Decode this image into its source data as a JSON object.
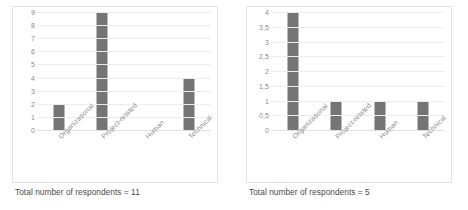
{
  "figure": {
    "panels": [
      {
        "panel_name": "left-chart-panel",
        "caption": "Total number of respondents = 11",
        "chart_data": {
          "type": "bar",
          "title": "",
          "xlabel": "",
          "ylabel": "",
          "categories": [
            "Organizational",
            "Project-related",
            "Human",
            "Technical"
          ],
          "values": [
            2,
            9,
            0,
            4
          ],
          "ylim": [
            0,
            9
          ],
          "ytick_step": 1,
          "yticks": [
            9,
            8,
            7,
            6,
            5,
            4,
            3,
            2,
            1,
            0
          ],
          "ytick_labels": [
            "9",
            "8",
            "7",
            "6",
            "5",
            "4",
            "3",
            "2",
            "1",
            "0"
          ],
          "grid": true,
          "legend": "none",
          "bar_color": "#757575",
          "gridline_color": "#ededed"
        }
      },
      {
        "panel_name": "right-chart-panel",
        "caption": "Total number of respondents = 5",
        "chart_data": {
          "type": "bar",
          "title": "",
          "xlabel": "",
          "ylabel": "",
          "categories": [
            "Organizational",
            "Project-related",
            "Human",
            "Technical"
          ],
          "values": [
            4,
            1,
            1,
            1
          ],
          "ylim": [
            0,
            4
          ],
          "ytick_step": 0.5,
          "yticks": [
            4,
            3.5,
            3,
            2.5,
            2,
            1.5,
            1,
            0.5,
            0
          ],
          "ytick_labels": [
            "4",
            "3,5",
            "3",
            "2,5",
            "2",
            "1,5",
            "1",
            "0,5",
            "0"
          ],
          "grid": true,
          "legend": "none",
          "bar_color": "#757575",
          "gridline_color": "#ededed"
        }
      }
    ]
  }
}
